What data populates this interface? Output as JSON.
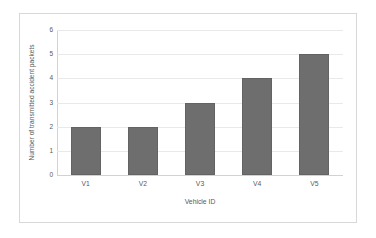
{
  "chart_data": {
    "type": "bar",
    "title": "",
    "categories": [
      "V1",
      "V2",
      "V3",
      "V4",
      "V5"
    ],
    "values": [
      2,
      2,
      3,
      4,
      5
    ],
    "series": [
      {
        "name": "Number of transmitted accident packets",
        "values": [
          2,
          2,
          3,
          4,
          5
        ]
      }
    ],
    "xlabel": "Vehicle ID",
    "ylabel": "Number of transmitted accident packets",
    "ylim": [
      0,
      6
    ],
    "yticks": [
      0,
      1,
      2,
      3,
      4,
      5,
      6
    ],
    "ytick_labels": [
      "0",
      "1",
      "2",
      "3",
      "4",
      "5",
      "6"
    ],
    "grid": "horizontal",
    "legend": "none",
    "bar_color": "#6e6e6e",
    "gridline_color": "#e9e9e9",
    "axis_color": "#d2d2d2",
    "frame_color": "#d8d8d8",
    "background_color": "#ffffff"
  }
}
